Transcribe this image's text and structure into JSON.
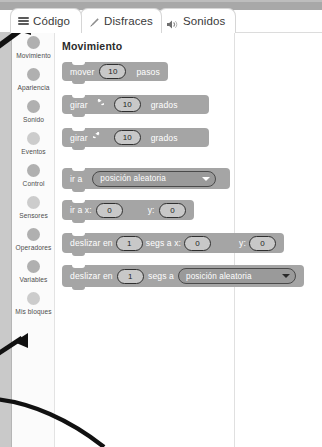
{
  "window": {
    "title_bar_color": "#a8a8a8"
  },
  "tabs": [
    {
      "id": "codigo",
      "label": "Código",
      "icon": "lines-icon",
      "selected": true
    },
    {
      "id": "disfraces",
      "label": "Disfraces",
      "icon": "brush-icon",
      "selected": false
    },
    {
      "id": "sonidos",
      "label": "Sonidos",
      "icon": "speaker-icon",
      "selected": false
    }
  ],
  "sidebar": {
    "items": [
      {
        "label": "Movimiento",
        "dot": "normal"
      },
      {
        "label": "Apariencia",
        "dot": "normal"
      },
      {
        "label": "Sonido",
        "dot": "normal"
      },
      {
        "label": "Eventos",
        "dot": "light"
      },
      {
        "label": "Control",
        "dot": "normal"
      },
      {
        "label": "Sensores",
        "dot": "light"
      },
      {
        "label": "Operadores",
        "dot": "normal"
      },
      {
        "label": "Variables",
        "dot": "normal"
      },
      {
        "label": "Mis bloques",
        "dot": "light"
      }
    ]
  },
  "palette": {
    "title": "Movimiento",
    "blocks": [
      {
        "name": "mover-pasos",
        "parts": [
          {
            "type": "text",
            "value": "mover"
          },
          {
            "type": "num",
            "value": "10"
          },
          {
            "type": "text",
            "value": "pasos"
          }
        ]
      },
      {
        "name": "girar-derecha-grados",
        "parts": [
          {
            "type": "text",
            "value": "girar"
          },
          {
            "type": "icon",
            "value": "rotate-right-icon"
          },
          {
            "type": "num",
            "value": "10"
          },
          {
            "type": "text",
            "value": "grados"
          }
        ]
      },
      {
        "name": "girar-izquierda-grados",
        "parts": [
          {
            "type": "text",
            "value": "girar"
          },
          {
            "type": "icon",
            "value": "rotate-left-icon"
          },
          {
            "type": "num",
            "value": "10"
          },
          {
            "type": "text",
            "value": "grados"
          }
        ]
      },
      {
        "name": "ir-a-posicion",
        "parts": [
          {
            "type": "text",
            "value": "ir a"
          },
          {
            "type": "dropdown",
            "value": "posición aleatoria",
            "caret": "white"
          }
        ]
      },
      {
        "name": "ir-a-xy",
        "parts": [
          {
            "type": "text",
            "value": "ir a x:"
          },
          {
            "type": "num",
            "value": "0"
          },
          {
            "type": "text",
            "value": "y:"
          },
          {
            "type": "num",
            "value": "0"
          }
        ]
      },
      {
        "name": "deslizar-segs-xy",
        "parts": [
          {
            "type": "text",
            "value": "deslizar en"
          },
          {
            "type": "num",
            "value": "1"
          },
          {
            "type": "text",
            "value": "segs a x:"
          },
          {
            "type": "num",
            "value": "0"
          },
          {
            "type": "text",
            "value": "y:"
          },
          {
            "type": "num",
            "value": "0"
          }
        ]
      },
      {
        "name": "deslizar-segs-posicion",
        "parts": [
          {
            "type": "text",
            "value": "deslizar en"
          },
          {
            "type": "num",
            "value": "1"
          },
          {
            "type": "text",
            "value": "segs a"
          },
          {
            "type": "dropdown",
            "value": "posición aleatoria",
            "caret": "dark"
          }
        ]
      }
    ]
  },
  "annotations": [
    {
      "name": "arrow-pointing-to-codigo-tab",
      "kind": "arrow"
    },
    {
      "name": "arrow-pointing-to-sidebar",
      "kind": "arrow"
    },
    {
      "name": "callout-curve",
      "kind": "curve"
    }
  ]
}
